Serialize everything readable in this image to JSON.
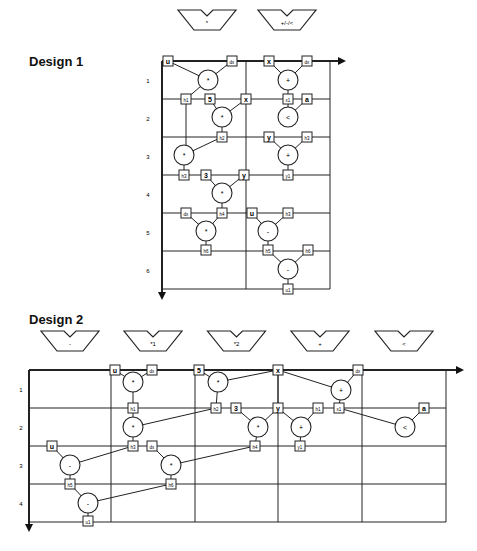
{
  "design1": {
    "title": "Design 1",
    "units": [
      "*",
      "+/-/<"
    ],
    "steps": [
      "1",
      "2",
      "3",
      "4",
      "5",
      "6"
    ],
    "ops": [
      {
        "id": "m1",
        "op": "*",
        "col": 0,
        "x": 208,
        "y": 80,
        "in": [
          "u",
          "dx"
        ],
        "out": "h1"
      },
      {
        "id": "m2",
        "op": "*",
        "col": 0,
        "x": 222,
        "y": 117,
        "in": [
          "5",
          "x"
        ],
        "out": "h2"
      },
      {
        "id": "m3",
        "op": "*",
        "col": 0,
        "x": 184,
        "y": 155,
        "in": [
          "h1",
          "h2"
        ],
        "out": "h3"
      },
      {
        "id": "m4",
        "op": "*",
        "col": 0,
        "x": 222,
        "y": 193,
        "in": [
          "3",
          "y"
        ],
        "out": "h4"
      },
      {
        "id": "m5",
        "op": "*",
        "col": 0,
        "x": 206,
        "y": 231,
        "in": [
          "dx",
          "h4"
        ],
        "out": "h6"
      },
      {
        "id": "a1",
        "op": "+",
        "col": 1,
        "x": 288,
        "y": 80,
        "in": [
          "x",
          "dx"
        ],
        "out": "x1"
      },
      {
        "id": "c1",
        "op": "<",
        "col": 1,
        "x": 288,
        "y": 117,
        "in": [
          "x1",
          "a"
        ],
        "out": "c"
      },
      {
        "id": "a2",
        "op": "+",
        "col": 1,
        "x": 288,
        "y": 155,
        "in": [
          "y",
          "h3"
        ],
        "out": "y1"
      },
      {
        "id": "s1",
        "op": "-",
        "col": 1,
        "x": 268,
        "y": 231,
        "in": [
          "u",
          "h3"
        ],
        "out": "h5"
      },
      {
        "id": "s2",
        "op": "-",
        "col": 1,
        "x": 288,
        "y": 269,
        "in": [
          "h5",
          "h6"
        ],
        "out": "u1"
      }
    ]
  },
  "design2": {
    "title": "Design 2",
    "units": [
      "-",
      "*1",
      "*2",
      "+",
      "<"
    ],
    "steps": [
      "1",
      "2",
      "3",
      "4"
    ],
    "ops": [
      {
        "op": "*",
        "x": 133,
        "y": 382,
        "label": "*"
      },
      {
        "op": "*",
        "x": 133,
        "y": 427,
        "label": "*"
      },
      {
        "op": "*",
        "x": 218,
        "y": 382,
        "label": "*"
      },
      {
        "op": "*",
        "x": 258,
        "y": 427,
        "label": "*"
      },
      {
        "op": "+",
        "x": 341,
        "y": 390,
        "label": "+"
      },
      {
        "op": "+",
        "x": 301,
        "y": 427,
        "label": "+"
      },
      {
        "op": "<",
        "x": 405,
        "y": 427,
        "label": "<"
      },
      {
        "op": "-",
        "x": 70,
        "y": 465,
        "label": "-"
      },
      {
        "op": "*",
        "x": 171,
        "y": 465,
        "label": "*"
      },
      {
        "op": "-",
        "x": 88,
        "y": 503,
        "label": "-"
      }
    ],
    "boxes": [
      {
        "t": "u",
        "x": 115,
        "y": 370
      },
      {
        "t": "dx",
        "x": 152,
        "y": 370
      },
      {
        "t": "5",
        "x": 199,
        "y": 370
      },
      {
        "t": "x",
        "x": 278,
        "y": 370
      },
      {
        "t": "dx",
        "x": 358,
        "y": 370
      },
      {
        "t": "h1",
        "x": 133,
        "y": 408
      },
      {
        "t": "h2",
        "x": 216,
        "y": 408
      },
      {
        "t": "3",
        "x": 236,
        "y": 408
      },
      {
        "t": "y",
        "x": 278,
        "y": 408
      },
      {
        "t": "h1",
        "x": 318,
        "y": 408
      },
      {
        "t": "x1",
        "x": 339,
        "y": 408
      },
      {
        "t": "a",
        "x": 424,
        "y": 408
      },
      {
        "t": "u",
        "x": 52,
        "y": 446
      },
      {
        "t": "h3",
        "x": 133,
        "y": 446
      },
      {
        "t": "dx",
        "x": 152,
        "y": 446
      },
      {
        "t": "h4",
        "x": 255,
        "y": 446
      },
      {
        "t": "y1",
        "x": 300,
        "y": 446
      },
      {
        "t": "h5",
        "x": 70,
        "y": 484
      },
      {
        "t": "h6",
        "x": 171,
        "y": 484
      },
      {
        "t": "u1",
        "x": 88,
        "y": 521
      }
    ]
  }
}
